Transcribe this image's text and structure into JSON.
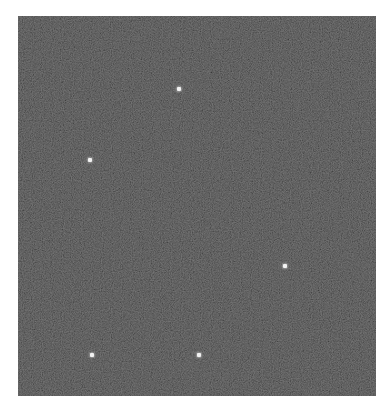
{
  "image": {
    "description": "Dark grainy field with five bright point sources",
    "background_color": "#ffffff",
    "field": {
      "x": 18,
      "y": 16,
      "width": 358,
      "height": 380,
      "base_color": "#3b3b3b"
    },
    "points": [
      {
        "x": 179,
        "y": 89,
        "color": "#f2f2f2"
      },
      {
        "x": 90,
        "y": 160,
        "color": "#f2f2f2"
      },
      {
        "x": 285,
        "y": 266,
        "color": "#f2f2f2"
      },
      {
        "x": 92,
        "y": 355,
        "color": "#f2f2f2"
      },
      {
        "x": 199,
        "y": 355,
        "color": "#f2f2f2"
      }
    ]
  }
}
